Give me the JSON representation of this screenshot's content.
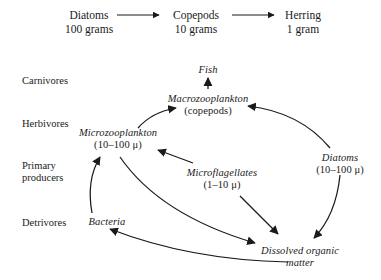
{
  "figure": {
    "background_color": "#ffffff",
    "ink_color": "#1a1a1a"
  },
  "top_chain": {
    "arrow_icon": "arrow-right-icon",
    "steps": [
      {
        "name": "Diatoms",
        "amount": "100 grams"
      },
      {
        "name": "Copepods",
        "amount": "10 grams"
      },
      {
        "name": "Herring",
        "amount": "1 gram"
      }
    ]
  },
  "trophic_levels": [
    {
      "line1": "Carnivores",
      "line2": ""
    },
    {
      "line1": "Herbivores",
      "line2": ""
    },
    {
      "line1": "Primary",
      "line2": "producers"
    },
    {
      "line1": "Detrivores",
      "line2": ""
    }
  ],
  "web_nodes": [
    {
      "id": "fish",
      "name": "Fish",
      "sub": ""
    },
    {
      "id": "macrozooplankton",
      "name": "Macrozooplankton",
      "sub": "(copepods)"
    },
    {
      "id": "microzooplankton",
      "name": "Microzooplankton",
      "sub": "(10–100 μ)"
    },
    {
      "id": "diatoms",
      "name": "Diatoms",
      "sub": "(10–100 μ)"
    },
    {
      "id": "microflagellates",
      "name": "Microflagellates",
      "sub": "(1–10 μ)"
    },
    {
      "id": "bacteria",
      "name": "Bacteria",
      "sub": ""
    },
    {
      "id": "dissolved_organic_matter",
      "name": "Dissolved organic",
      "sub": "matter"
    }
  ],
  "web_arrows": [
    {
      "from": "microzooplankton",
      "to": "macrozooplankton"
    },
    {
      "from": "diatoms",
      "to": "macrozooplankton"
    },
    {
      "from": "macrozooplankton",
      "to": "fish"
    },
    {
      "from": "microflagellates",
      "to": "microzooplankton"
    },
    {
      "from": "bacteria",
      "to": "microzooplankton"
    },
    {
      "from": "microzooplankton",
      "to": "dissolved_organic_matter"
    },
    {
      "from": "microflagellates",
      "to": "dissolved_organic_matter"
    },
    {
      "from": "diatoms",
      "to": "dissolved_organic_matter"
    },
    {
      "from": "dissolved_organic_matter",
      "to": "bacteria"
    }
  ]
}
